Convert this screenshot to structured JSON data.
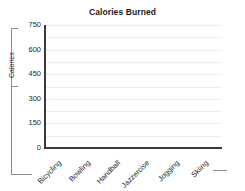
{
  "chart_data": {
    "type": "bar",
    "title": "Calories Burned",
    "xlabel": "",
    "ylabel": "Calories",
    "categories": [
      "Bicycling",
      "Bowling",
      "Handball",
      "Jazzercise",
      "Jogging",
      "Skiing"
    ],
    "values": [
      null,
      null,
      null,
      null,
      null,
      null
    ],
    "ylim": [
      0,
      750
    ],
    "yticks": [
      0,
      150,
      300,
      450,
      600,
      750
    ],
    "ytick_labels": [
      "0",
      "150",
      "300",
      "450",
      "600",
      "750"
    ],
    "gridlines": [
      75,
      150,
      225,
      300,
      375,
      450,
      525,
      600,
      675,
      750
    ],
    "grid": true,
    "grid_interval": 75,
    "legend": null,
    "legend_position": "none",
    "note": "plot area empty - no data series plotted"
  },
  "colors": {
    "background": "#ffffff",
    "axis": "#3a3a3a",
    "gridline": "#ededed",
    "frame": "#8d8d8d",
    "text": "#1f1f1f",
    "title": "#1b1b1b"
  }
}
